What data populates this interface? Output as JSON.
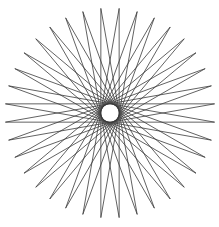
{
  "figure": {
    "type": "star-polygon",
    "points": 36,
    "step": 17,
    "center": [
      110,
      113
    ],
    "outer_radius": 105,
    "rotation_deg": 5,
    "stroke_color": "#3a3a3a",
    "stroke_width": 0.8,
    "background": "#ffffff"
  }
}
